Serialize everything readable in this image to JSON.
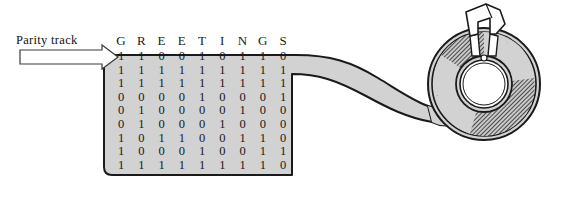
{
  "figure": {
    "background_color": "#ffffff",
    "tape_fill": "#d2d2d2",
    "outline_color": "#1a1a1a"
  },
  "annotation": {
    "parity_track_label": "Parity track",
    "arrow_icon": "right-arrow-icon"
  },
  "tape": {
    "column_headers": [
      "G",
      "R",
      "E",
      "E",
      "T",
      "I",
      "N",
      "G",
      "S"
    ],
    "rows": [
      {
        "name": "parity-track-row",
        "bits": [
          "1",
          "1",
          "0",
          "0",
          "1",
          "0",
          "1",
          "1",
          "0"
        ]
      },
      {
        "name": "track-row-2",
        "bits": [
          "1",
          "1",
          "1",
          "1",
          "1",
          "1",
          "1",
          "1",
          "1"
        ]
      },
      {
        "name": "track-row-3",
        "bits": [
          "1",
          "1",
          "1",
          "1",
          "1",
          "1",
          "1",
          "1",
          "1"
        ]
      },
      {
        "name": "track-row-4",
        "bits": [
          "0",
          "0",
          "0",
          "0",
          "1",
          "0",
          "0",
          "0",
          "1"
        ]
      },
      {
        "name": "track-row-5",
        "bits": [
          "0",
          "1",
          "0",
          "0",
          "0",
          "0",
          "1",
          "0",
          "0"
        ]
      },
      {
        "name": "track-row-6",
        "bits": [
          "0",
          "1",
          "0",
          "0",
          "0",
          "1",
          "0",
          "0",
          "0"
        ]
      },
      {
        "name": "track-row-7",
        "bits": [
          "1",
          "0",
          "1",
          "1",
          "0",
          "0",
          "1",
          "1",
          "0"
        ]
      },
      {
        "name": "track-row-8",
        "bits": [
          "1",
          "0",
          "0",
          "0",
          "1",
          "0",
          "0",
          "1",
          "1"
        ]
      },
      {
        "name": "track-row-9",
        "bits": [
          "1",
          "1",
          "1",
          "1",
          "1",
          "1",
          "1",
          "1",
          "0"
        ]
      }
    ]
  },
  "reel": {
    "name": "tape-reel",
    "hub_color": "#ffffff",
    "body_color": "#d2d2d2",
    "clip_icon": "reel-clip-icon"
  }
}
